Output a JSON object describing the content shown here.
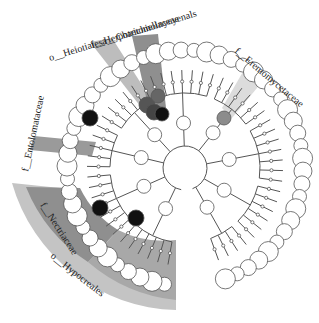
{
  "diagram": {
    "type": "cladogram",
    "center": [
      185,
      168
    ],
    "leaf_radius": 118,
    "colors": {
      "branch": "#555555",
      "node_fill": "#ffffff",
      "highlight_dark": "#111111",
      "highlight_mid": "#555555",
      "highlight_light": "#8c8c8c",
      "shade_outer": "#bdbdbd",
      "shade_inner": "#8f8f8f",
      "shade_light": "#d4d4d4"
    },
    "clade_labels": [
      {
        "text": "o__Heiotiaiesa__Chaetomoinyeyenals",
        "x": 50,
        "y": 61,
        "rotate": -17,
        "size": 10
      },
      {
        "text": "f__Herpotrichiellaceae",
        "x": 92,
        "y": 48,
        "rotate": -17,
        "size": 10
      },
      {
        "text": "f__Eremomycetaceae",
        "x": 234,
        "y": 52,
        "rotate": 40,
        "size": 10
      },
      {
        "text": "f__Entolomataceae",
        "x": 28,
        "y": 172,
        "rotate": -78,
        "size": 10
      },
      {
        "text": "f__Nectriaceae",
        "x": 40,
        "y": 205,
        "rotate": 57,
        "size": 10
      },
      {
        "text": "o__Hypocreales",
        "x": 50,
        "y": 257,
        "rotate": 38,
        "size": 10
      }
    ]
  }
}
